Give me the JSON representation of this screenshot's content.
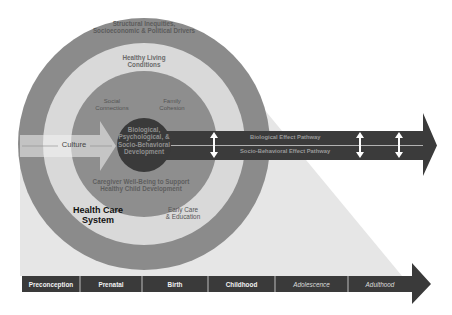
{
  "diagram": {
    "colors": {
      "background": "#ffffff",
      "outer_ring": "#8b8b8b",
      "light_ring": "#d9d9d9",
      "mid_circle": "#8e8e8e",
      "core_circle": "#3a3a3a",
      "triangle": "#e6e6e6",
      "pathway_band": "#3b3b3b",
      "timeline_bar": "#3a3a3a"
    },
    "rings": {
      "outer_label": [
        "Structural Inequities,",
        "Socioeconomic & Political Drivers"
      ],
      "light_label": [
        "Healthy Living",
        "Conditions"
      ],
      "social_label": [
        "Social",
        "Connections"
      ],
      "family_label": [
        "Family",
        "Cohesion"
      ],
      "caregiver_label": [
        "Caregiver Well-Being to Support",
        "Healthy Child Development"
      ],
      "core_label": [
        "Biological,",
        "Psychological, &",
        "Socio-Behavioral",
        "Development"
      ],
      "health_care_label": [
        "Health Care",
        "System"
      ],
      "early_care_label": [
        "Early Care",
        "& Education"
      ]
    },
    "culture": {
      "label": "Culture"
    },
    "pathways": {
      "biological": "Biological Effect Pathway",
      "socio_behavioral": "Socio-Behavioral Effect Pathway",
      "bidirectional_arrows": 3
    },
    "timeline": {
      "stages": [
        {
          "label": "Preconception",
          "italic": false
        },
        {
          "label": "Prenatal",
          "italic": false
        },
        {
          "label": "Birth",
          "italic": false
        },
        {
          "label": "Childhood",
          "italic": false
        },
        {
          "label": "Adolescence",
          "italic": true
        },
        {
          "label": "Adulthood",
          "italic": true
        }
      ]
    }
  }
}
